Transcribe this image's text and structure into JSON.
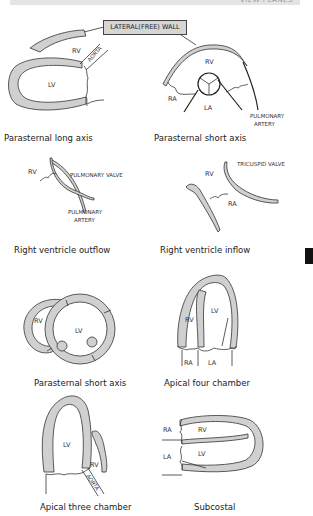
{
  "header": {
    "running_title": "VIEW PLANES"
  },
  "callout": {
    "label": "LATERAL(FREE) WALL"
  },
  "panels": [
    {
      "id": "parasternal-long-axis",
      "caption": "Parasternal long axis",
      "labels": {
        "rv": "RV",
        "lv": "LV",
        "aorta": "AORTA"
      }
    },
    {
      "id": "parasternal-short-axis-top",
      "caption": "Parasternal short axis",
      "labels": {
        "rv": "RV",
        "ra": "RA",
        "la": "LA",
        "pulmonary_artery_1": "PULMONARY",
        "pulmonary_artery_2": "ARTERY"
      }
    },
    {
      "id": "right-ventricle-outflow",
      "caption": "Right ventricle outflow",
      "labels": {
        "rv": "RV",
        "pulmonary_valve": "PULMONARY VALVE",
        "pulmonary_artery_1": "PULMONARY",
        "pulmonary_artery_2": "ARTERY"
      }
    },
    {
      "id": "right-ventricle-inflow",
      "caption": "Right ventricle inflow",
      "labels": {
        "rv": "RV",
        "ra": "RA",
        "tricuspid_valve": "TRICUSPID VALVE"
      }
    },
    {
      "id": "parasternal-short-axis-bottom",
      "caption": "Parasternal short axis",
      "labels": {
        "rv": "RV",
        "lv": "LV"
      }
    },
    {
      "id": "apical-four-chamber",
      "caption": "Apical four chamber",
      "labels": {
        "rv": "RV",
        "lv": "LV",
        "ra": "RA",
        "la": "LA"
      }
    },
    {
      "id": "apical-three-chamber",
      "caption": "Apical three chamber",
      "labels": {
        "lv": "LV",
        "rv": "RV",
        "aorta": "AORTA"
      }
    },
    {
      "id": "subcostal",
      "caption": "Subcostal",
      "labels": {
        "ra": "RA",
        "rv": "RV",
        "la": "LA",
        "lv": "LV"
      }
    }
  ],
  "colors": {
    "wall_fill": "#d0d0d0",
    "stroke": "#333333",
    "header_bar": "#e4e4e4",
    "side_tab": "#111111"
  }
}
